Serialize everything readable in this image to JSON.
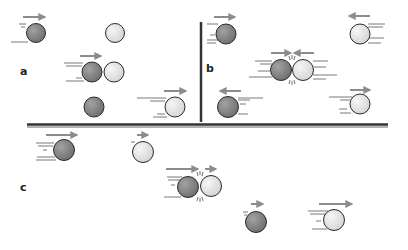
{
  "labels": {
    "a": "a",
    "b": "b",
    "c": "c"
  },
  "colors": {
    "dark_ball": "#8a8a8a",
    "light_ball": "#e6e6e6",
    "outline": "#2a2a2a",
    "arrow": "#8c8c8c",
    "divider": "#333333",
    "speed_lines": "#555555"
  },
  "panels": [
    {
      "id": "a",
      "description": "Moving dark ball strikes stationary light ball; dark ball stops, light ball moves off",
      "stages": [
        {
          "balls": [
            {
              "type": "dark",
              "x": 36,
              "y": 33,
              "velocity": "right",
              "arrow_len": 24
            },
            {
              "type": "light",
              "x": 115,
              "y": 33,
              "velocity": "none"
            }
          ]
        },
        {
          "balls": [
            {
              "type": "dark",
              "x": 92,
              "y": 72,
              "velocity": "right",
              "arrow_len": 22,
              "contact": true
            },
            {
              "type": "light",
              "x": 114,
              "y": 72,
              "velocity": "none"
            }
          ]
        },
        {
          "balls": [
            {
              "type": "dark",
              "x": 94,
              "y": 107,
              "velocity": "none"
            },
            {
              "type": "light",
              "x": 175,
              "y": 107,
              "velocity": "right",
              "arrow_len": 24
            }
          ]
        }
      ]
    },
    {
      "id": "b",
      "description": "Two balls approach each other head-on and rebound in opposite directions",
      "stages": [
        {
          "balls": [
            {
              "type": "dark",
              "x": 226,
              "y": 34,
              "velocity": "right",
              "arrow_len": 22
            },
            {
              "type": "light",
              "x": 360,
              "y": 34,
              "velocity": "left",
              "arrow_len": 22
            }
          ]
        },
        {
          "balls": [
            {
              "type": "dark",
              "x": 281,
              "y": 70,
              "velocity": "right",
              "contact": true
            },
            {
              "type": "light",
              "x": 303,
              "y": 70,
              "velocity": "left"
            }
          ]
        },
        {
          "balls": [
            {
              "type": "dark",
              "x": 228,
              "y": 107,
              "velocity": "left",
              "arrow_len": 22
            },
            {
              "type": "light",
              "x": 360,
              "y": 104,
              "velocity": "right",
              "arrow_len": 22
            }
          ]
        }
      ]
    },
    {
      "id": "c",
      "description": "Fast dark ball catches slower light ball; after collision dark ball slows and light ball speeds up",
      "stages": [
        {
          "balls": [
            {
              "type": "dark",
              "x": 64,
              "y": 150,
              "velocity": "right",
              "arrow_len": 32
            },
            {
              "type": "light",
              "x": 143,
              "y": 152,
              "velocity": "right",
              "arrow_len": 12
            }
          ]
        },
        {
          "balls": [
            {
              "type": "dark",
              "x": 188,
              "y": 187,
              "velocity": "right",
              "arrow_len": 32,
              "contact": true
            },
            {
              "type": "light",
              "x": 211,
              "y": 186,
              "velocity": "right",
              "arrow_len": 12
            }
          ]
        },
        {
          "balls": [
            {
              "type": "dark",
              "x": 256,
              "y": 222,
              "velocity": "right",
              "arrow_len": 12
            },
            {
              "type": "light",
              "x": 334,
              "y": 220,
              "velocity": "right",
              "arrow_len": 32
            }
          ]
        }
      ]
    }
  ]
}
